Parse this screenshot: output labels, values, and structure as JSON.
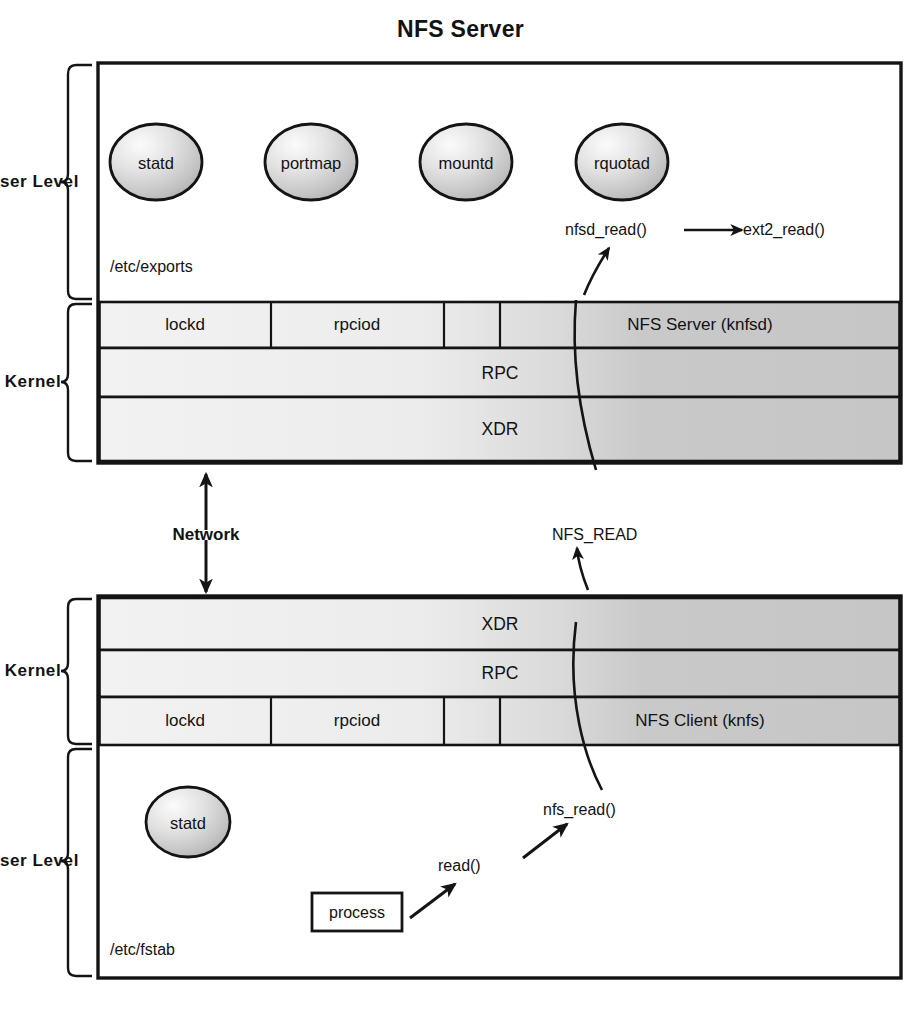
{
  "diagram": {
    "title": "NFS Server",
    "network_label": "Network",
    "server": {
      "user_level_label": "User Level",
      "kernel_label": "Kernel",
      "config_file": "/etc/exports",
      "daemons": [
        {
          "name": "statd"
        },
        {
          "name": "portmap"
        },
        {
          "name": "mountd"
        },
        {
          "name": "rquotad"
        }
      ],
      "calls": {
        "nfsd_read": "nfsd_read()",
        "ext2_read": "ext2_read()"
      },
      "kernel_rows": [
        {
          "cells": [
            {
              "label": "lockd"
            },
            {
              "label": "rpciod"
            },
            {
              "label": ""
            },
            {
              "label": "NFS Server (knfsd)"
            }
          ]
        },
        {
          "cells": [
            {
              "label": "RPC"
            }
          ]
        },
        {
          "cells": [
            {
              "label": "XDR"
            }
          ]
        }
      ]
    },
    "client": {
      "user_level_label": "User Level",
      "kernel_label": "Kernel",
      "config_file": "/etc/fstab",
      "daemons": [
        {
          "name": "statd"
        }
      ],
      "process_box_label": "process",
      "calls": {
        "read": "read()",
        "nfs_read": "nfs_read()"
      },
      "kernel_rows": [
        {
          "cells": [
            {
              "label": "XDR"
            }
          ]
        },
        {
          "cells": [
            {
              "label": "RPC"
            }
          ]
        },
        {
          "cells": [
            {
              "label": "lockd"
            },
            {
              "label": "rpciod"
            },
            {
              "label": ""
            },
            {
              "label": "NFS Client (knfs)"
            }
          ]
        }
      ]
    },
    "wire_label": "NFS_READ",
    "colors": {
      "stroke": "#141414",
      "band_light": "#f0f0f0",
      "band_dark": "#c9c9c9",
      "ellipse_light": "#f3f3f3",
      "ellipse_dark": "#b9b9b9",
      "page_background": "#ffffff"
    }
  }
}
